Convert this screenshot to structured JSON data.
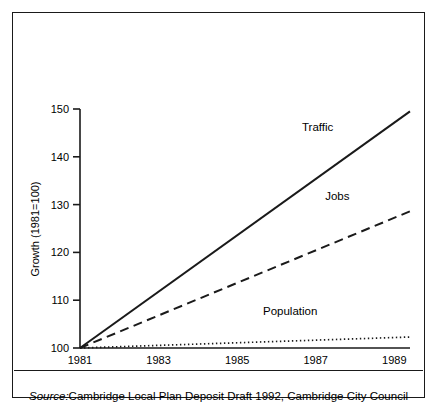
{
  "figure": {
    "source_prefix": "Source:",
    "source_text": " Cambridge Local Plan Deposit Draft 1992, Cambridge City Council"
  },
  "chart_data": {
    "type": "line",
    "title": "",
    "xlabel": "",
    "ylabel": "Growth (1981=100)",
    "xlim": [
      1981,
      1989.4
    ],
    "ylim": [
      100,
      150
    ],
    "grid": false,
    "legend": "inline-labels",
    "x_ticks": [
      "1981",
      "1983",
      "1985",
      "1987",
      "1989"
    ],
    "x_tick_values": [
      1981,
      1983,
      1985,
      1987,
      1989
    ],
    "y_ticks": [
      "100",
      "110",
      "120",
      "130",
      "140",
      "150"
    ],
    "y_tick_values": [
      100,
      110,
      120,
      130,
      140,
      150
    ],
    "x": [
      1981,
      1989.4
    ],
    "series": [
      {
        "name": "Traffic",
        "style": "solid",
        "color": "#1a1a1a",
        "values": [
          100,
          149.5
        ],
        "label_x": 1987.05,
        "label_y": 145.5
      },
      {
        "name": "Jobs",
        "style": "dashed",
        "color": "#1a1a1a",
        "values": [
          100,
          128.6
        ],
        "label_x": 1987.55,
        "label_y": 131.0
      },
      {
        "name": "Population",
        "style": "dotted",
        "color": "#1a1a1a",
        "values": [
          100,
          102.3
        ],
        "label_x": 1986.35,
        "label_y": 106.8
      }
    ]
  }
}
